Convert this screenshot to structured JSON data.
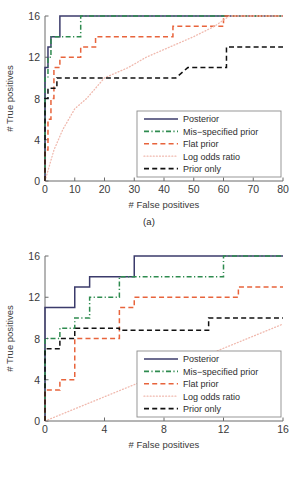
{
  "figure": {
    "background": "#ffffff",
    "panels": [
      "a",
      "b"
    ]
  },
  "colors": {
    "posterior": "#3b3b6b",
    "mis_specified_prior": "#2e8b4f",
    "flat_prior": "#e8643c",
    "log_odds_ratio": "#f0b9ae",
    "prior_only": "#111111",
    "axis": "#6b6b6b",
    "text": "#3a3a3a"
  },
  "panel_a": {
    "caption": "(a)",
    "xlabel": "# False positives",
    "ylabel": "# True positives",
    "xticks": [
      "0",
      "10",
      "20",
      "30",
      "40",
      "50",
      "60",
      "70",
      "80"
    ],
    "yticks": [
      "0",
      "4",
      "8",
      "12",
      "16"
    ],
    "legend": [
      {
        "label": "Posterior",
        "style": "solid",
        "color_key": "posterior"
      },
      {
        "label": "Mis−specified prior",
        "style": "dashdot",
        "color_key": "mis_specified_prior"
      },
      {
        "label": "Flat prior",
        "style": "dashed",
        "color_key": "flat_prior"
      },
      {
        "label": "Log odds ratio",
        "style": "dotted",
        "color_key": "log_odds_ratio"
      },
      {
        "label": "Prior only",
        "style": "dashed",
        "color_key": "prior_only"
      }
    ]
  },
  "panel_b": {
    "caption": "(b)",
    "xlabel": "# False positives",
    "ylabel": "# True positives",
    "xticks": [
      "0",
      "4",
      "8",
      "12",
      "16"
    ],
    "yticks": [
      "0",
      "4",
      "8",
      "12",
      "16"
    ],
    "legend": [
      {
        "label": "Posterior",
        "style": "solid",
        "color_key": "posterior"
      },
      {
        "label": "Mis−specified prior",
        "style": "dashdot",
        "color_key": "mis_specified_prior"
      },
      {
        "label": "Flat prior",
        "style": "dashed",
        "color_key": "flat_prior"
      },
      {
        "label": "Log odds ratio",
        "style": "dotted",
        "color_key": "log_odds_ratio"
      },
      {
        "label": "Prior only",
        "style": "dashed",
        "color_key": "prior_only"
      }
    ]
  },
  "chart_data": [
    {
      "type": "line",
      "panel": "a",
      "title": "(a)",
      "xlabel": "# False positives",
      "ylabel": "# True positives",
      "xlim": [
        0,
        80
      ],
      "ylim": [
        0,
        16
      ],
      "xticks": [
        0,
        10,
        20,
        30,
        40,
        50,
        60,
        70,
        80
      ],
      "yticks": [
        0,
        4,
        8,
        12,
        16
      ],
      "grid": false,
      "legend_position": "lower-right",
      "series": [
        {
          "name": "Posterior",
          "style": "solid",
          "color": "#3b3b6b",
          "points": [
            [
              0,
              0
            ],
            [
              0,
              8
            ],
            [
              0,
              11
            ],
            [
              1,
              11
            ],
            [
              1,
              13
            ],
            [
              2,
              13
            ],
            [
              2,
              14
            ],
            [
              3,
              14
            ],
            [
              5,
              14
            ],
            [
              5,
              16
            ],
            [
              80,
              16
            ]
          ]
        },
        {
          "name": "Mis−specified prior",
          "style": "dashdot",
          "color": "#2e8b4f",
          "points": [
            [
              0,
              0
            ],
            [
              0,
              9
            ],
            [
              0,
              10
            ],
            [
              1,
              10
            ],
            [
              1,
              12
            ],
            [
              2,
              12
            ],
            [
              2,
              14
            ],
            [
              12,
              14
            ],
            [
              12,
              16
            ],
            [
              80,
              16
            ]
          ]
        },
        {
          "name": "Flat prior",
          "style": "dashed",
          "color": "#e8643c",
          "points": [
            [
              0,
              0
            ],
            [
              0,
              3
            ],
            [
              1,
              3
            ],
            [
              1,
              6
            ],
            [
              2,
              6
            ],
            [
              2,
              8
            ],
            [
              3,
              8
            ],
            [
              3,
              11
            ],
            [
              5,
              11
            ],
            [
              5,
              12
            ],
            [
              12,
              12
            ],
            [
              12,
              13
            ],
            [
              17,
              13
            ],
            [
              17,
              14
            ],
            [
              43,
              14
            ],
            [
              43,
              15
            ],
            [
              57,
              15
            ],
            [
              60,
              15
            ],
            [
              60,
              16
            ],
            [
              80,
              16
            ]
          ]
        },
        {
          "name": "Log odds ratio",
          "style": "dotted",
          "color": "#f0b9ae",
          "points": [
            [
              0,
              0
            ],
            [
              1,
              1
            ],
            [
              3,
              3
            ],
            [
              6,
              5
            ],
            [
              10,
              7
            ],
            [
              14,
              8
            ],
            [
              20,
              10
            ],
            [
              28,
              11
            ],
            [
              34,
              12
            ],
            [
              42,
              13
            ],
            [
              50,
              14
            ],
            [
              57,
              15
            ],
            [
              62,
              16
            ],
            [
              80,
              16
            ]
          ]
        },
        {
          "name": "Prior only",
          "style": "dashed",
          "color": "#111111",
          "points": [
            [
              0,
              0
            ],
            [
              0,
              8
            ],
            [
              1,
              8
            ],
            [
              1,
              9
            ],
            [
              4,
              9
            ],
            [
              4,
              10
            ],
            [
              44,
              10
            ],
            [
              48,
              11
            ],
            [
              58,
              11
            ],
            [
              61,
              11
            ],
            [
              61,
              13
            ],
            [
              80,
              13
            ]
          ]
        }
      ]
    },
    {
      "type": "line",
      "panel": "b",
      "title": "(b)",
      "xlabel": "# False positives",
      "ylabel": "# True positives",
      "xlim": [
        0,
        16
      ],
      "ylim": [
        0,
        16
      ],
      "xticks": [
        0,
        4,
        8,
        12,
        16
      ],
      "yticks": [
        0,
        4,
        8,
        12,
        16
      ],
      "grid": false,
      "legend_position": "lower-right",
      "series": [
        {
          "name": "Posterior",
          "style": "solid",
          "color": "#3b3b6b",
          "points": [
            [
              0,
              0
            ],
            [
              0,
              11
            ],
            [
              2,
              11
            ],
            [
              2,
              13
            ],
            [
              3,
              13
            ],
            [
              3,
              14
            ],
            [
              6,
              14
            ],
            [
              6,
              16
            ],
            [
              16,
              16
            ]
          ]
        },
        {
          "name": "Mis−specified prior",
          "style": "dashdot",
          "color": "#2e8b4f",
          "points": [
            [
              0,
              0
            ],
            [
              0,
              8
            ],
            [
              1,
              8
            ],
            [
              1,
              9
            ],
            [
              2,
              9
            ],
            [
              2,
              10
            ],
            [
              3,
              10
            ],
            [
              3,
              12
            ],
            [
              5,
              12
            ],
            [
              5,
              14
            ],
            [
              12,
              14
            ],
            [
              12,
              16
            ],
            [
              16,
              16
            ]
          ]
        },
        {
          "name": "Flat prior",
          "style": "dashed",
          "color": "#e8643c",
          "points": [
            [
              0,
              0
            ],
            [
              0,
              3
            ],
            [
              1,
              3
            ],
            [
              1,
              4
            ],
            [
              2,
              4
            ],
            [
              2,
              8
            ],
            [
              5,
              8
            ],
            [
              5,
              11
            ],
            [
              6,
              11
            ],
            [
              6,
              12
            ],
            [
              13,
              12
            ],
            [
              13,
              13
            ],
            [
              16,
              13
            ]
          ]
        },
        {
          "name": "Log odds ratio",
          "style": "dotted",
          "color": "#f0b9ae",
          "points": [
            [
              0,
              0
            ],
            [
              16,
              9.4
            ]
          ]
        },
        {
          "name": "Prior only",
          "style": "dashed",
          "color": "#111111",
          "points": [
            [
              0,
              0
            ],
            [
              0,
              7
            ],
            [
              1,
              7
            ],
            [
              1,
              8
            ],
            [
              2,
              8
            ],
            [
              2,
              9
            ],
            [
              5,
              9
            ],
            [
              5,
              8.8
            ],
            [
              11,
              8.8
            ],
            [
              11,
              10
            ],
            [
              16,
              10
            ]
          ]
        }
      ]
    }
  ]
}
